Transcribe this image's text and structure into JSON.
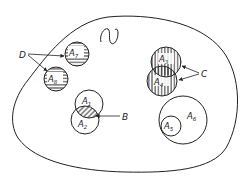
{
  "diagram": {
    "type": "venn-set-diagram",
    "universe": {
      "label": ""
    },
    "colors": {
      "stroke": "#222222",
      "background": "#ffffff",
      "hatch": "#222222"
    },
    "sets": [
      {
        "id": "A1",
        "base": "A",
        "sub": "1",
        "cx": 89,
        "cy": 104,
        "r": 14,
        "fill": "none"
      },
      {
        "id": "A2",
        "base": "A",
        "sub": "2",
        "cx": 85,
        "cy": 120,
        "r": 14,
        "fill": "none"
      },
      {
        "id": "A3",
        "base": "A",
        "sub": "3",
        "cx": 166,
        "cy": 62,
        "r": 15,
        "fill": "vertical-hatch"
      },
      {
        "id": "A4",
        "base": "A",
        "sub": "4",
        "cx": 162,
        "cy": 81,
        "r": 15,
        "fill": "vertical-hatch"
      },
      {
        "id": "A5",
        "base": "A",
        "sub": "5",
        "cx": 171,
        "cy": 126,
        "r": 10,
        "fill": "none"
      },
      {
        "id": "A6",
        "base": "A",
        "sub": "6",
        "cx": 183,
        "cy": 120,
        "r": 24,
        "fill": "none"
      },
      {
        "id": "A7",
        "base": "A",
        "sub": "7",
        "cx": 77,
        "cy": 54,
        "r": 12,
        "fill": "horizontal-hatch"
      },
      {
        "id": "A8",
        "base": "A",
        "sub": "8",
        "cx": 56,
        "cy": 79,
        "r": 12,
        "fill": "horizontal-hatch"
      }
    ],
    "callouts": [
      {
        "id": "B",
        "label": "B",
        "meaning": "intersection of A1 and A2 (diagonal hatch)",
        "targets": [
          "A1∩A2"
        ]
      },
      {
        "id": "C",
        "label": "C",
        "meaning": "overlapping sets A3 and A4",
        "targets": [
          "A3",
          "A4"
        ]
      },
      {
        "id": "D",
        "label": "D",
        "meaning": "sets crossing the universe boundary",
        "targets": [
          "A7",
          "A8"
        ]
      }
    ],
    "decorations": [
      {
        "id": "squiggle",
        "shape": "S-curve"
      }
    ]
  }
}
